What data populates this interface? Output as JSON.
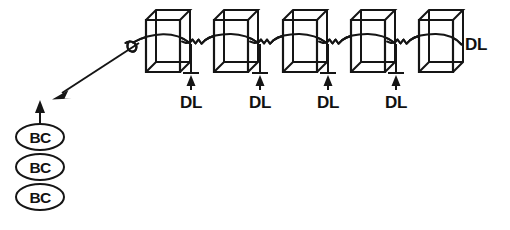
{
  "figure": {
    "background_color": "#ffffff",
    "ink_color": "#151515",
    "width": 510,
    "height": 230
  },
  "labels": {
    "linker_label": "DL",
    "complex_label": "BC"
  },
  "nucleosomes": [
    {
      "id": "nucleosome-1",
      "x": 146,
      "y": 10,
      "w": 34,
      "h": 62,
      "depth": 10
    },
    {
      "id": "nucleosome-2",
      "x": 214,
      "y": 10,
      "w": 34,
      "h": 62,
      "depth": 10
    },
    {
      "id": "nucleosome-3",
      "x": 283,
      "y": 10,
      "w": 34,
      "h": 62,
      "depth": 10
    },
    {
      "id": "nucleosome-4",
      "x": 351,
      "y": 10,
      "w": 34,
      "h": 62,
      "depth": 10
    },
    {
      "id": "nucleosome-5",
      "x": 419,
      "y": 10,
      "w": 34,
      "h": 62,
      "depth": 10
    }
  ],
  "linker_measures": [
    {
      "id": "linker-measure-1",
      "x": 191,
      "label": "DL",
      "label_x": 191,
      "label_y": 105
    },
    {
      "id": "linker-measure-2",
      "x": 260,
      "label": "DL",
      "label_x": 260,
      "label_y": 105
    },
    {
      "id": "linker-measure-3",
      "x": 328,
      "label": "DL",
      "label_x": 328,
      "label_y": 105
    },
    {
      "id": "linker-measure-4",
      "x": 396,
      "label": "DL",
      "label_x": 396,
      "label_y": 105
    }
  ],
  "right_linker": {
    "id": "right-linker-label",
    "label": "DL",
    "label_x": 465,
    "label_y": 49
  },
  "binding_complexes": [
    {
      "id": "binding-complex-1",
      "cx": 40,
      "cy": 137,
      "rx": 24,
      "ry": 13,
      "label": "BC"
    },
    {
      "id": "binding-complex-2",
      "cx": 40,
      "cy": 167,
      "rx": 24,
      "ry": 13,
      "label": "BC"
    },
    {
      "id": "binding-complex-3",
      "cx": 40,
      "cy": 197,
      "rx": 24,
      "ry": 13,
      "label": "BC"
    }
  ],
  "arrows": {
    "diagonal": {
      "id": "diagonal-arrow",
      "from_x": 137,
      "from_y": 44,
      "to_x": 55,
      "to_y": 98,
      "description": "arrow from DNA free end down-left toward binding complexes"
    },
    "vertical": {
      "id": "vertical-arrow",
      "from_x": 40,
      "from_y": 124,
      "to_x": 40,
      "to_y": 101,
      "description": "arrow from top binding complex pointing upward"
    }
  },
  "dna_strand": {
    "id": "dna-strand",
    "free_end_loop": {
      "cx": 133,
      "cy": 45,
      "rx": 5,
      "ry": 6
    },
    "baseline_y": 41,
    "description": "continuous DNA strand arcing over each nucleosome with squiggly linker segments between them"
  }
}
